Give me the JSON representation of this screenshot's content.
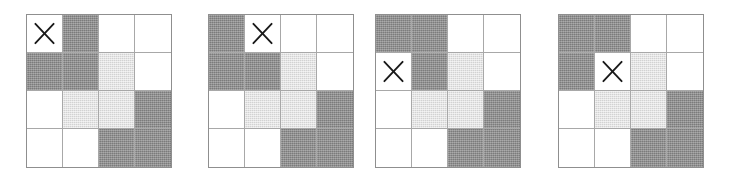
{
  "figure": {
    "panel_count": 4,
    "grid_rows": 4,
    "grid_cols": 4,
    "marker_glyph": "x-marker",
    "colors": {
      "white": "#ffffff",
      "light_gray": "#d2d2d2",
      "dark_gray": "#8a8a8a",
      "grid_line": "#a8a8a8",
      "border": "#8f8f8f",
      "marker": "#1a1a1a"
    },
    "fill_legend": [
      {
        "key": "white",
        "label": "empty"
      },
      {
        "key": "light",
        "label": "light gray"
      },
      {
        "key": "dark",
        "label": "dark gray"
      }
    ],
    "panels": [
      {
        "name": "panel-1",
        "label": "1",
        "left": 26,
        "marker": {
          "row": 1,
          "col": 1
        },
        "cells": [
          [
            "white",
            "dark",
            "white",
            "white"
          ],
          [
            "dark",
            "dark",
            "light",
            "white"
          ],
          [
            "white",
            "light",
            "light",
            "dark"
          ],
          [
            "white",
            "white",
            "dark",
            "dark"
          ]
        ]
      },
      {
        "name": "panel-2",
        "label": "2",
        "left": 208,
        "marker": {
          "row": 1,
          "col": 2
        },
        "cells": [
          [
            "dark",
            "white",
            "white",
            "white"
          ],
          [
            "dark",
            "dark",
            "light",
            "white"
          ],
          [
            "white",
            "light",
            "light",
            "dark"
          ],
          [
            "white",
            "white",
            "dark",
            "dark"
          ]
        ]
      },
      {
        "name": "panel-3",
        "label": "3",
        "left": 375,
        "marker": {
          "row": 2,
          "col": 1
        },
        "cells": [
          [
            "dark",
            "dark",
            "white",
            "white"
          ],
          [
            "white",
            "dark",
            "light",
            "white"
          ],
          [
            "white",
            "light",
            "light",
            "dark"
          ],
          [
            "white",
            "white",
            "dark",
            "dark"
          ]
        ]
      },
      {
        "name": "panel-4",
        "label": "4",
        "left": 558,
        "marker": {
          "row": 2,
          "col": 2
        },
        "cells": [
          [
            "dark",
            "dark",
            "white",
            "white"
          ],
          [
            "dark",
            "white",
            "light",
            "white"
          ],
          [
            "white",
            "light",
            "light",
            "dark"
          ],
          [
            "white",
            "white",
            "dark",
            "dark"
          ]
        ]
      }
    ]
  }
}
